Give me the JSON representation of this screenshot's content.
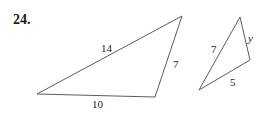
{
  "problem": {
    "number": "24."
  },
  "figures": {
    "large_triangle": {
      "side_top": "14",
      "side_right": "7",
      "side_bottom": "10"
    },
    "small_triangle": {
      "side_left": "7",
      "side_right": "y",
      "side_bottom": "5"
    }
  },
  "colors": {
    "line": "#4a4a4a",
    "text": "#1a1a1a",
    "background": "#ffffff"
  }
}
